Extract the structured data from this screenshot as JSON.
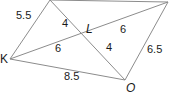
{
  "diagram": {
    "type": "geometry-quadrilateral-with-diagonals",
    "vertices": {
      "K": {
        "label": "K",
        "x": 10,
        "y": 59
      },
      "O": {
        "label": "O",
        "x": 125,
        "y": 80
      },
      "L": {
        "label": "L",
        "x": 90,
        "y": 38
      }
    },
    "unlabeled_vertices": {
      "top_left": {
        "x": 50,
        "y": 0
      },
      "top_right": {
        "x": 168,
        "y": 2
      }
    },
    "segment_lengths": {
      "top_left_to_K": "5.5",
      "top_left_to_L": "4",
      "L_to_O": "4",
      "K_to_L": "6",
      "L_to_top_right": "6",
      "K_to_O": "8.5",
      "O_to_top_right": "6.5"
    },
    "colors": {
      "line": "#8c8c8c",
      "text": "#1a1a1a",
      "background": "#ffffff"
    }
  }
}
